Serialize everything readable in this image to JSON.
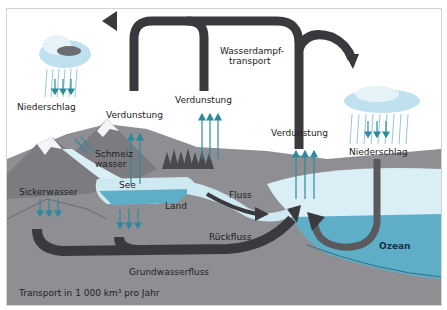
{
  "diagram": {
    "labels": {
      "precipitation_left": "Niederschlag",
      "precipitation_right": "Niederschlag",
      "evaporation_lake": "Verdunstung",
      "evaporation_forest": "Verdunstung",
      "evaporation_ocean": "Verdunstung",
      "vapor_transport_1": "Wasserdampf-",
      "vapor_transport_2": "transport",
      "meltwater_1": "Schmeiz",
      "meltwater_2": "wasser",
      "lake": "See",
      "seepage": "Sickerwasser",
      "land": "Land",
      "river": "Fluss",
      "runoff": "Rückfluss",
      "groundwater_flow": "Grundwasserfluss",
      "ocean": "Ozean",
      "footnote": "Transport in 1 000 km³ pro Jahr"
    },
    "colors": {
      "arrow_dark": "#3a3a3e",
      "arrow_teal": "#2b8a9e",
      "land_gray": "#8f8f93",
      "mountain_gray": "#7c7c80",
      "water_light": "#cfe9f2",
      "ocean": "#5eaec8",
      "snow": "#f2f6f8",
      "cloud": "#bfe0ee"
    }
  }
}
